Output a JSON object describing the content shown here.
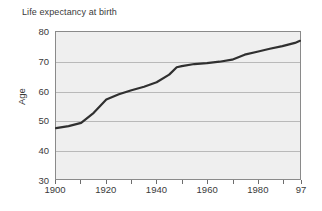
{
  "chart_data": {
    "type": "line",
    "title": "Life expectancy at birth",
    "xlabel": "",
    "ylabel": "Age",
    "xlim": [
      1900,
      1997
    ],
    "ylim": [
      30,
      80
    ],
    "grid": true,
    "legend": false,
    "x_tick_labels": [
      "1900",
      "1920",
      "1940",
      "1960",
      "1980",
      "97"
    ],
    "x_tick_values": [
      1900,
      1920,
      1940,
      1960,
      1980,
      1997
    ],
    "x_minor_tick_values": [
      1910,
      1930,
      1950,
      1970,
      1990
    ],
    "y_tick_labels": [
      "30",
      "40",
      "50",
      "60",
      "70",
      "80"
    ],
    "y_tick_values": [
      30,
      40,
      50,
      60,
      70,
      80
    ],
    "line_color": "#303030",
    "plot_background": "#efefef",
    "series": [
      {
        "name": "Life expectancy at birth",
        "x": [
          1900,
          1905,
          1910,
          1915,
          1920,
          1925,
          1930,
          1935,
          1940,
          1945,
          1948,
          1950,
          1955,
          1960,
          1965,
          1970,
          1975,
          1980,
          1985,
          1990,
          1995,
          1997
        ],
        "values": [
          47.3,
          48.0,
          49.1,
          52.5,
          57.0,
          58.8,
          60.2,
          61.4,
          62.9,
          65.5,
          68.0,
          68.4,
          69.1,
          69.4,
          69.9,
          70.6,
          72.3,
          73.3,
          74.3,
          75.2,
          76.3,
          77.0
        ]
      }
    ]
  }
}
